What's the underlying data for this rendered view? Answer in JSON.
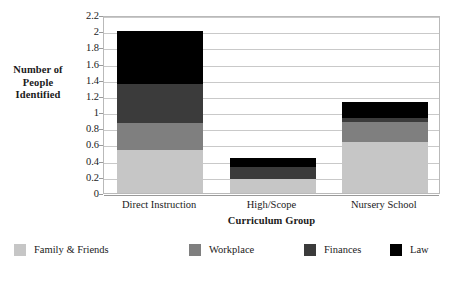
{
  "chart_data": {
    "type": "bar",
    "stacked": true,
    "title": "",
    "xlabel": "Curriculum Group",
    "ylabel": "Number of People Identified",
    "ylabel_lines": [
      "Number of",
      "People",
      "Identified"
    ],
    "categories": [
      "Direct Instruction",
      "High/Scope",
      "Nursery School"
    ],
    "series": [
      {
        "name": "Family & Friends",
        "color": "#c6c6c6",
        "values": [
          0.53,
          0.17,
          0.63
        ]
      },
      {
        "name": "Workplace",
        "color": "#7f7f7f",
        "values": [
          0.34,
          0.0,
          0.25
        ]
      },
      {
        "name": "Finances",
        "color": "#3b3b3b",
        "values": [
          0.48,
          0.15,
          0.05
        ]
      },
      {
        "name": "Law",
        "color": "#000000",
        "values": [
          0.65,
          0.11,
          0.2
        ]
      }
    ],
    "totals": [
      2.0,
      0.43,
      1.13
    ],
    "ylim": [
      0,
      2.2
    ],
    "ytick_step": 0.2,
    "yticks": [
      "0",
      "0.2",
      "0.4",
      "0.6",
      "0.8",
      "1",
      "1.2",
      "1.4",
      "1.6",
      "1.8",
      "2",
      "2.2"
    ],
    "grid": true,
    "legend_position": "bottom"
  },
  "legend": {
    "items": [
      {
        "label": "Family & Friends",
        "color": "#c6c6c6"
      },
      {
        "label": "Workplace",
        "color": "#7f7f7f"
      },
      {
        "label": "Finances",
        "color": "#3b3b3b"
      },
      {
        "label": "Law",
        "color": "#000000"
      }
    ]
  }
}
